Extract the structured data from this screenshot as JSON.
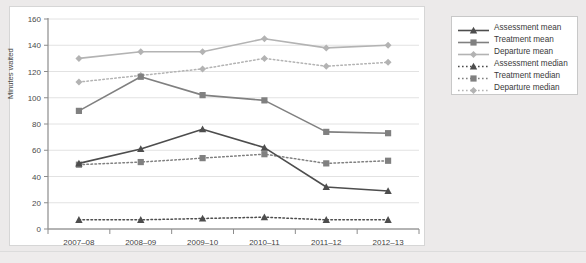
{
  "chart_data": {
    "type": "line",
    "title": "",
    "xlabel": "",
    "ylabel": "Minutes waited",
    "categories": [
      "2007–08",
      "2008–09",
      "2009–10",
      "2010–11",
      "2011–12",
      "2012–13"
    ],
    "ylim": [
      0,
      160
    ],
    "ytick_step": 20,
    "yticks": [
      0,
      20,
      40,
      60,
      80,
      100,
      120,
      140,
      160
    ],
    "grid": true,
    "legend_position": "right",
    "series": [
      {
        "name": "Assessment mean",
        "values": [
          50,
          61,
          76,
          62,
          32,
          29
        ],
        "color": "#4d4d4d",
        "style": "solid",
        "marker": "triangle"
      },
      {
        "name": "Treatment mean",
        "values": [
          90,
          116,
          102,
          98,
          74,
          73
        ],
        "color": "#808080",
        "style": "solid",
        "marker": "square"
      },
      {
        "name": "Departure mean",
        "values": [
          130,
          135,
          135,
          145,
          138,
          140
        ],
        "color": "#b3b3b3",
        "style": "solid",
        "marker": "diamond"
      },
      {
        "name": "Assessment median",
        "values": [
          7,
          7,
          8,
          9,
          7,
          7
        ],
        "color": "#4d4d4d",
        "style": "dashed",
        "marker": "triangle"
      },
      {
        "name": "Treatment median",
        "values": [
          49,
          51,
          54,
          57,
          50,
          52
        ],
        "color": "#808080",
        "style": "dashed",
        "marker": "square"
      },
      {
        "name": "Departure median",
        "values": [
          112,
          117,
          122,
          130,
          124,
          127
        ],
        "color": "#b3b3b3",
        "style": "dashed",
        "marker": "diamond"
      }
    ]
  },
  "legend": {
    "items": [
      "Assessment mean",
      "Treatment mean",
      "Departure mean",
      "Assessment median",
      "Treatment median",
      "Departure median"
    ]
  },
  "axes": {
    "y_title": "Minutes waited",
    "y_ticks": [
      "0",
      "20",
      "40",
      "60",
      "80",
      "100",
      "120",
      "140",
      "160"
    ],
    "x_ticks": [
      "2007–08",
      "2008–09",
      "2009–10",
      "2010–11",
      "2011–12",
      "2012–13"
    ]
  },
  "footer": {
    "caption": ""
  }
}
